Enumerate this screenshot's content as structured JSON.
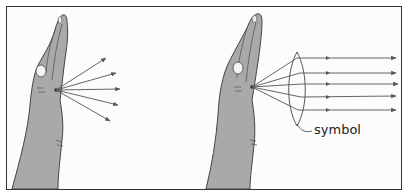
{
  "figure": {
    "panels": [
      {
        "id": "left",
        "description": "hand with diverging light rays",
        "rays": 5
      },
      {
        "id": "right",
        "description": "hand with rays passing through lens becoming parallel",
        "rays": 5,
        "lens_label": "symbol"
      }
    ],
    "colors": {
      "skin": "#a9a9a9",
      "outline": "#444444",
      "ray": "#555555",
      "border": "#333333",
      "background": "#fcfcfc"
    }
  }
}
